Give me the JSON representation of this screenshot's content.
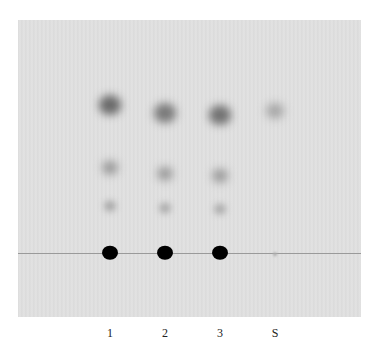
{
  "figure": {
    "type": "TLC plate",
    "lanes": [
      {
        "label": "1",
        "x": 110
      },
      {
        "label": "2",
        "x": 165
      },
      {
        "label": "3",
        "x": 220
      },
      {
        "label": "S",
        "x": 275
      }
    ],
    "baseline_y": 253,
    "spots": [
      {
        "lane": "1",
        "y": 253,
        "size": 16,
        "color": "#000000",
        "blur": 0.5
      },
      {
        "lane": "1",
        "y": 206,
        "size": 12,
        "color": "#a8a8a8",
        "blur": 3
      },
      {
        "lane": "1",
        "y": 168,
        "size": 16,
        "color": "#9a9a9a",
        "blur": 4
      },
      {
        "lane": "1",
        "y": 105,
        "size": 22,
        "color": "#6a6a6a",
        "blur": 4
      },
      {
        "lane": "2",
        "y": 253,
        "size": 16,
        "color": "#000000",
        "blur": 0.5
      },
      {
        "lane": "2",
        "y": 208,
        "size": 12,
        "color": "#acacac",
        "blur": 3
      },
      {
        "lane": "2",
        "y": 174,
        "size": 16,
        "color": "#9c9c9c",
        "blur": 4
      },
      {
        "lane": "2",
        "y": 113,
        "size": 22,
        "color": "#7a7a7a",
        "blur": 4
      },
      {
        "lane": "3",
        "y": 253,
        "size": 16,
        "color": "#000000",
        "blur": 0.5
      },
      {
        "lane": "3",
        "y": 209,
        "size": 12,
        "color": "#acacac",
        "blur": 3
      },
      {
        "lane": "3",
        "y": 176,
        "size": 16,
        "color": "#9c9c9c",
        "blur": 4
      },
      {
        "lane": "3",
        "y": 115,
        "size": 22,
        "color": "#727272",
        "blur": 4
      },
      {
        "lane": "S",
        "y": 111,
        "size": 18,
        "color": "#a8a8a8",
        "blur": 4
      },
      {
        "lane": "S",
        "y": 254,
        "size": 4,
        "color": "#b0b0b0",
        "blur": 1
      }
    ]
  }
}
